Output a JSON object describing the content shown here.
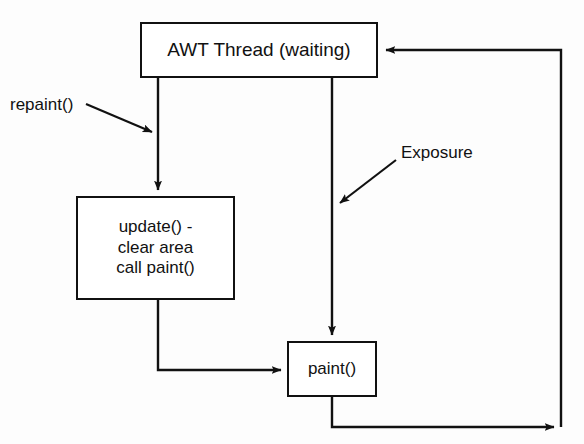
{
  "diagram": {
    "stroke_color": "#111111",
    "background_color": "#fdfdfd",
    "width": 584,
    "height": 444,
    "nodes": [
      {
        "id": "awt-thread",
        "label": "AWT Thread (waiting)",
        "x": 140,
        "y": 22,
        "w": 238,
        "h": 56
      },
      {
        "id": "update",
        "label": "update() -\nclear area\ncall paint()",
        "x": 76,
        "y": 196,
        "w": 159,
        "h": 104
      },
      {
        "id": "paint",
        "label": "paint()",
        "x": 287,
        "y": 341,
        "w": 90,
        "h": 56
      }
    ],
    "annotations": [
      {
        "id": "repaint",
        "label": "repaint()",
        "x": 10,
        "y": 95
      },
      {
        "id": "exposure",
        "label": "Exposure",
        "x": 401,
        "y": 143
      }
    ],
    "edges": [
      {
        "id": "awt-to-update",
        "from": "awt-thread",
        "to": "update",
        "kind": "vertical-arrow"
      },
      {
        "id": "awt-to-paint",
        "from": "awt-thread",
        "to": "paint",
        "kind": "vertical-arrow"
      },
      {
        "id": "repaint-trigger",
        "from": "repaint",
        "to": "awt-to-update",
        "kind": "diagonal-arrow"
      },
      {
        "id": "exposure-trigger",
        "from": "exposure",
        "to": "awt-to-paint",
        "kind": "diagonal-arrow"
      },
      {
        "id": "update-to-paint",
        "from": "update",
        "to": "paint",
        "kind": "elbow-arrow"
      },
      {
        "id": "paint-to-awt",
        "from": "paint",
        "to": "awt-thread",
        "kind": "loop-back-arrow"
      }
    ]
  }
}
